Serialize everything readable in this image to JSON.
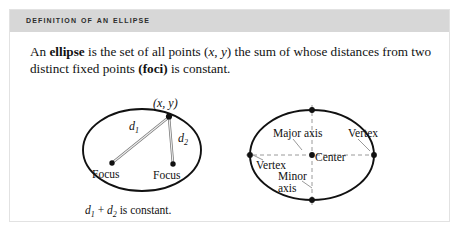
{
  "card": {
    "header_title": "Definition of an Ellipse",
    "header_bg": "#d7d7d7",
    "border_color": "#e2e2e2",
    "background": "#ffffff"
  },
  "definition": {
    "line1_part1": "An ",
    "line1_bold": "ellipse",
    "line1_part2": " is the set of all points (",
    "line1_italic_x": "x",
    "line1_part3": ", ",
    "line1_italic_y": "y",
    "line1_part4": ") the sum of whose distances from",
    "line2_part1": "two distinct fixed points ",
    "line2_bold": "(foci)",
    "line2_part2": " is constant."
  },
  "figure_left": {
    "name": "ellipse-foci-diagram",
    "point_label_open": "(",
    "point_label_x": "x",
    "point_label_comma": ", ",
    "point_label_y": "y",
    "point_label_close": ")",
    "d1_letter": "d",
    "d1_sub": "1",
    "d2_letter": "d",
    "d2_sub": "2",
    "focus_left_label": "Focus",
    "focus_right_label": "Focus",
    "caption_d1": "d",
    "caption_d1_sub": "1",
    "caption_plus": "+",
    "caption_d2": "d",
    "caption_d2_sub": "2",
    "caption_text": "is constant.",
    "stroke_color": "#111111",
    "point_color": "#111111"
  },
  "figure_right": {
    "name": "ellipse-axes-diagram",
    "major_axis_label": "Major axis",
    "minor_axis_label_line1": "Minor",
    "minor_axis_label_line2": "axis",
    "vertex_left_label": "Vertex",
    "vertex_right_label": "Vertex",
    "center_label": "Center",
    "stroke_color": "#111111",
    "axis_color": "#9a9a9a",
    "point_color": "#111111"
  }
}
